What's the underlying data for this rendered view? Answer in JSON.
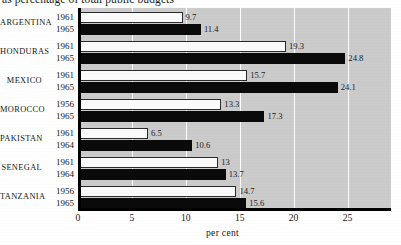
{
  "chart_data": {
    "type": "bar",
    "orientation": "horizontal",
    "title": "as percentage of total public budgets",
    "xlabel": "per cent",
    "ylabel": "",
    "xlim": [
      0,
      28.5
    ],
    "xticks": [
      0,
      5,
      10,
      15,
      20,
      25
    ],
    "xtick_labels": [
      "0",
      "5",
      "10",
      "15",
      "20",
      "25"
    ],
    "grid": true,
    "grid_axis": "x",
    "legend": false,
    "legend_position": "none",
    "categories": [
      "ARGENTINA",
      "HONDURAS",
      "MEXICO",
      "MOROCCO",
      "PAKISTAN",
      "SENEGAL",
      "TANZANIA"
    ],
    "groups": [
      {
        "category": "ARGENTINA",
        "bars": [
          {
            "year": "1961",
            "value": 9.7,
            "label": "9.7",
            "style": "light"
          },
          {
            "year": "1965",
            "value": 11.4,
            "label": "11.4",
            "style": "dark"
          }
        ]
      },
      {
        "category": "HONDURAS",
        "bars": [
          {
            "year": "1961",
            "value": 19.3,
            "label": "19.3",
            "style": "light"
          },
          {
            "year": "1965",
            "value": 24.8,
            "label": "24.8",
            "style": "dark"
          }
        ]
      },
      {
        "category": "MEXICO",
        "bars": [
          {
            "year": "1961",
            "value": 15.7,
            "label": "15.7",
            "style": "light"
          },
          {
            "year": "1965",
            "value": 24.1,
            "label": "24.1",
            "style": "dark"
          }
        ]
      },
      {
        "category": "MOROCCO",
        "bars": [
          {
            "year": "1956",
            "value": 13.3,
            "label": "13.3",
            "style": "light"
          },
          {
            "year": "1965",
            "value": 17.3,
            "label": "17.3",
            "style": "dark"
          }
        ]
      },
      {
        "category": "PAKISTAN",
        "bars": [
          {
            "year": "1961",
            "value": 6.5,
            "label": "6.5",
            "style": "light"
          },
          {
            "year": "1964",
            "value": 10.6,
            "label": "10.6",
            "style": "dark"
          }
        ]
      },
      {
        "category": "SENEGAL",
        "bars": [
          {
            "year": "1961",
            "value": 13.0,
            "label": "13",
            "style": "light"
          },
          {
            "year": "1964",
            "value": 13.7,
            "label": "13.7",
            "style": "dark"
          }
        ]
      },
      {
        "category": "TANZANIA",
        "bars": [
          {
            "year": "1956",
            "value": 14.7,
            "label": "14.7",
            "style": "light"
          },
          {
            "year": "1965",
            "value": 15.6,
            "label": "15.6",
            "style": "dark"
          }
        ]
      }
    ],
    "series": [
      {
        "name": "earlier year",
        "values": [
          9.7,
          19.3,
          15.7,
          13.3,
          6.5,
          13.0,
          14.7
        ],
        "style": "light"
      },
      {
        "name": "later year",
        "values": [
          11.4,
          24.8,
          24.1,
          17.3,
          10.6,
          13.7,
          15.6
        ],
        "style": "dark"
      }
    ],
    "colors": {
      "plot_background": "#cbcbcb",
      "gridline": "#fdfdfd",
      "axis": "#000000",
      "bar_light_fill": "#fbfbfb",
      "bar_light_border": "#2a2a2a",
      "bar_dark_fill": "#0a0a0a",
      "text": "#1b1b1b"
    }
  }
}
